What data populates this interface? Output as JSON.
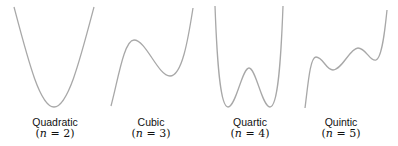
{
  "panels": [
    {
      "name": "Quadratic",
      "degree_label": "(n = 2)",
      "n": "2"
    },
    {
      "name": "Cubic",
      "degree_label": "(n = 3)",
      "n": "3"
    },
    {
      "name": "Quartic",
      "degree_label": "(n = 4)",
      "n": "4"
    },
    {
      "name": "Quintic",
      "degree_label": "(n = 5)",
      "n": "5"
    }
  ],
  "colors": {
    "curve": "#a8a8a8",
    "text": "#111111",
    "background": "#ffffff"
  }
}
